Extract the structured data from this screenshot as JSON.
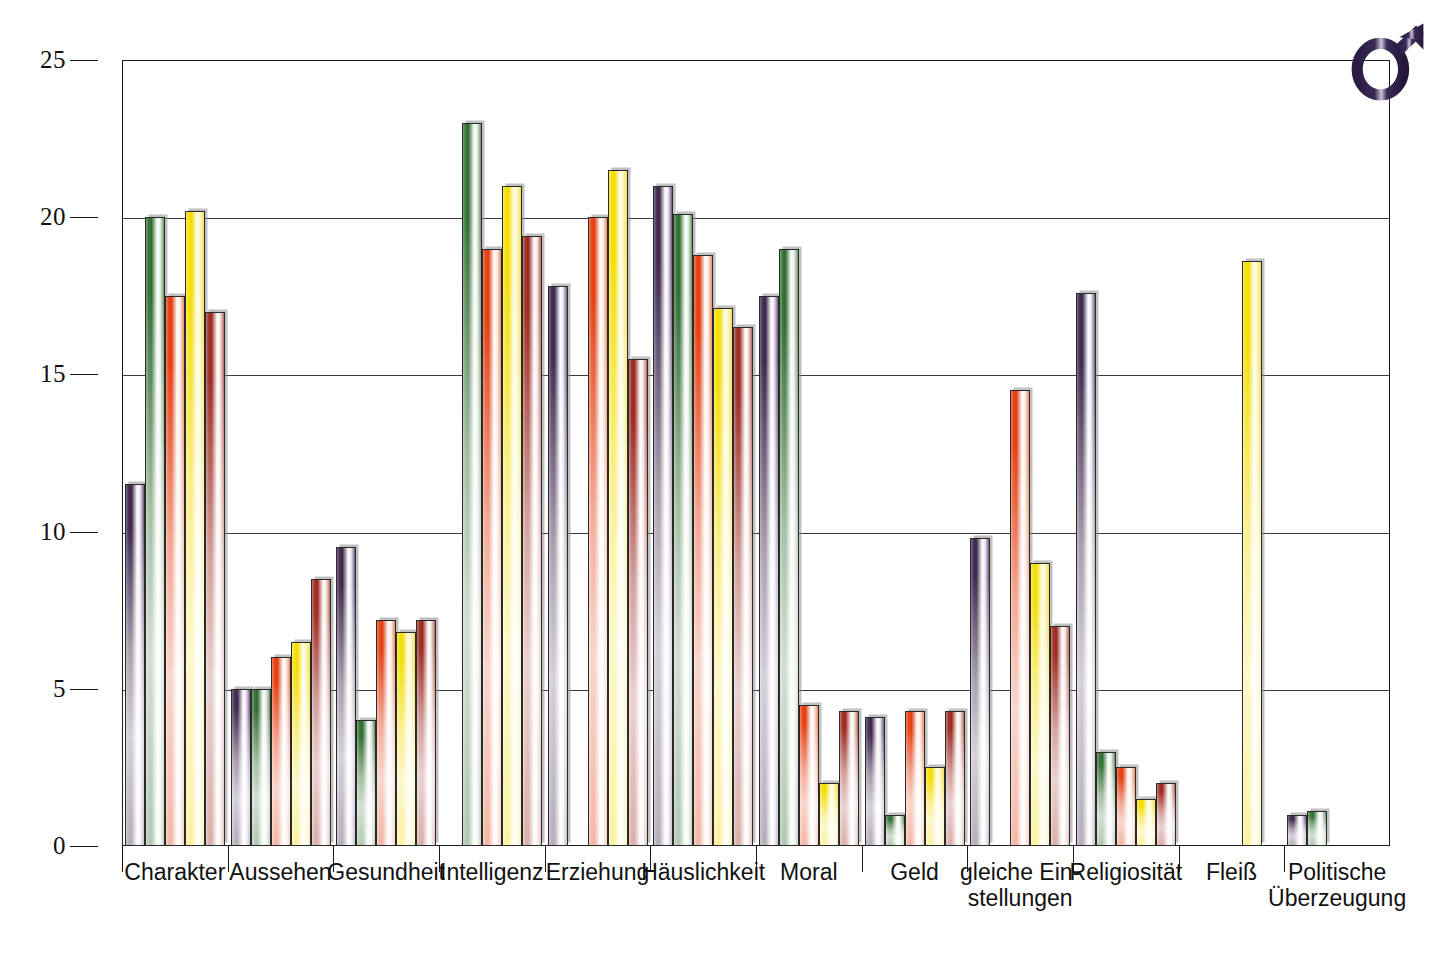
{
  "figure": {
    "symbol": {
      "name": "male-gender-symbol",
      "glyph": "♂",
      "color": "#2e1f47"
    }
  },
  "chart_data": {
    "type": "bar",
    "title": "",
    "subtitle": "",
    "xlabel": "",
    "ylabel": "",
    "ylim": [
      0,
      25
    ],
    "yticks": [
      0,
      5,
      10,
      15,
      20,
      25
    ],
    "ytick_labels": [
      "0",
      "5",
      "10",
      "15",
      "20",
      "25"
    ],
    "grid": true,
    "grid_axis": "y",
    "legend": "none",
    "legend_position": "none",
    "bar_colors": [
      "#4a3358",
      "#3c7a3a",
      "#e8491d",
      "#f2dc00",
      "#a6352c"
    ],
    "categories": [
      "Charakter",
      "Aussehen",
      "Gesundheit",
      "Intelligenz",
      "Erziehung",
      "Häuslichkeit",
      "Moral",
      "Geld",
      "gleiche Ein-\nstellungen",
      "Religiosität",
      "Fleiß",
      "Politische\nÜberzeugung"
    ],
    "series": [
      {
        "name": "series-1",
        "color": "#4a3358",
        "values": [
          11.5,
          5.0,
          9.5,
          0.0,
          17.8,
          21.0,
          17.5,
          4.1,
          9.8,
          17.6,
          0.0,
          1.0
        ]
      },
      {
        "name": "series-2",
        "color": "#3c7a3a",
        "values": [
          20.0,
          5.0,
          4.0,
          23.0,
          0.0,
          20.1,
          19.0,
          1.0,
          0.0,
          3.0,
          0.0,
          1.1
        ]
      },
      {
        "name": "series-3",
        "color": "#e8491d",
        "values": [
          17.5,
          6.0,
          7.2,
          19.0,
          20.0,
          18.8,
          4.5,
          4.3,
          14.5,
          2.5,
          0.0,
          0.0
        ]
      },
      {
        "name": "series-4",
        "color": "#f2dc00",
        "values": [
          20.2,
          6.5,
          6.8,
          21.0,
          21.5,
          17.1,
          2.0,
          2.5,
          9.0,
          1.5,
          18.6,
          0.0
        ]
      },
      {
        "name": "series-5",
        "color": "#a6352c",
        "values": [
          17.0,
          8.5,
          7.2,
          19.4,
          15.5,
          16.5,
          4.3,
          4.3,
          7.0,
          2.0,
          0.0,
          0.0
        ]
      }
    ]
  }
}
